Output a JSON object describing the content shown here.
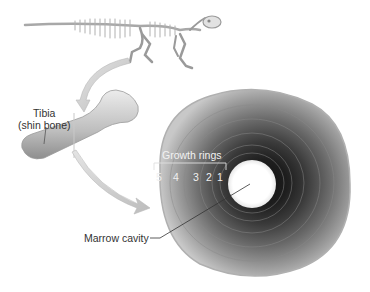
{
  "figure": {
    "labels": {
      "tibia": "Tibia",
      "tibia_sub": "(shin bone)",
      "growth_rings": "Growth rings",
      "marrow": "Marrow cavity"
    },
    "ring_numbers": [
      "5",
      "4",
      "3",
      "2",
      "1"
    ],
    "illustrations": [
      "dinosaur-skeleton",
      "tibia-bone",
      "bone-cross-section"
    ],
    "colors": {
      "background": "#ffffff",
      "bone_light": "#d9d9d9",
      "bone_dark": "#3a3a3a",
      "cavity": "#ffffff",
      "arrow": "#cfcfcf",
      "text": "#333333"
    }
  }
}
